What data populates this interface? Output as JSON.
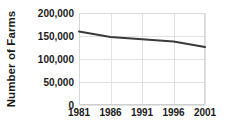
{
  "chart_data": {
    "type": "line",
    "title": "",
    "xlabel": "",
    "ylabel": "Number of Farms",
    "x": [
      1981,
      1986,
      1991,
      1996,
      2001
    ],
    "categories": [
      "1981",
      "1986",
      "1991",
      "1996",
      "2001"
    ],
    "values": [
      160000,
      148000,
      143000,
      138000,
      126000
    ],
    "series": [
      {
        "name": "Number of Farms",
        "values": [
          160000,
          148000,
          143000,
          138000,
          126000
        ],
        "color": "#3a3a3a"
      }
    ],
    "xlim": [
      1981,
      2001
    ],
    "ylim": [
      0,
      200000
    ],
    "y_ticks": [
      0,
      50000,
      100000,
      150000,
      200000
    ],
    "y_tick_labels": [
      "0",
      "50,000",
      "100,000",
      "150,000",
      "200,000"
    ],
    "x_ticks": [
      1981,
      1986,
      1991,
      1996,
      2001
    ],
    "x_tick_labels": [
      "1981",
      "1986",
      "1991",
      "1996",
      "2001"
    ],
    "grid": true,
    "grid_color": "#e2e2e2",
    "legend": false,
    "legend_position": "none",
    "line_color": "#3a3a3a",
    "line_width": 2,
    "markers": false,
    "background": "#ffffff"
  }
}
